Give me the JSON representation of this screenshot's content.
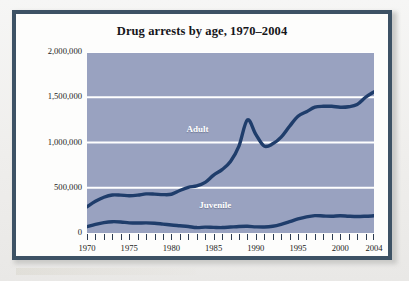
{
  "figure": {
    "frame_color": "#3d5265",
    "page_background": "#f1f0ee",
    "inner_background": "#fdfdfc"
  },
  "chart_data": {
    "type": "line",
    "title": "Drug arrests by age, 1970–2004",
    "xlabel": "",
    "ylabel": "",
    "xlim": [
      1970,
      2004
    ],
    "ylim": [
      0,
      2000000
    ],
    "grid": true,
    "gridline_color": "#ffffff",
    "plot_background": "#99a2c0",
    "line_color": "#1f3d6b",
    "legend_position": "inline-labels",
    "ytick_labels": [
      "0",
      "500,000",
      "1,000,000",
      "1,500,000",
      "2,000,000"
    ],
    "ytick_values": [
      0,
      500000,
      1000000,
      1500000,
      2000000
    ],
    "xtick_labels": [
      "1970",
      "1975",
      "1980",
      "1985",
      "1990",
      "1995",
      "2000",
      "2004"
    ],
    "xtick_values": [
      1970,
      1975,
      1980,
      1985,
      1990,
      1995,
      2000,
      2004
    ],
    "minor_xticks_every": 1,
    "x": [
      1970,
      1971,
      1972,
      1973,
      1974,
      1975,
      1976,
      1977,
      1978,
      1979,
      1980,
      1981,
      1982,
      1983,
      1984,
      1985,
      1986,
      1987,
      1988,
      1989,
      1990,
      1991,
      1992,
      1993,
      1994,
      1995,
      1996,
      1997,
      1998,
      1999,
      2000,
      2001,
      2002,
      2003,
      2004
    ],
    "series": [
      {
        "name": "Adult",
        "label": "Adult",
        "label_x": 1983.1,
        "label_y": 1140000,
        "values": [
          290000,
          350000,
          395000,
          420000,
          418000,
          412000,
          418000,
          432000,
          430000,
          424000,
          428000,
          470000,
          505000,
          520000,
          560000,
          640000,
          700000,
          790000,
          960000,
          1250000,
          1090000,
          960000,
          985000,
          1060000,
          1180000,
          1290000,
          1340000,
          1390000,
          1400000,
          1400000,
          1390000,
          1395000,
          1420000,
          1500000,
          1560000
        ]
      },
      {
        "name": "Juvenile",
        "label": "Juvenile",
        "label_x": 1985.2,
        "label_y": 300000,
        "values": [
          70000,
          95000,
          115000,
          125000,
          122000,
          112000,
          110000,
          112000,
          108000,
          98000,
          88000,
          80000,
          72000,
          60000,
          65000,
          62000,
          60000,
          66000,
          72000,
          74000,
          68000,
          66000,
          74000,
          95000,
          125000,
          155000,
          178000,
          192000,
          188000,
          185000,
          190000,
          185000,
          182000,
          185000,
          190000
        ]
      }
    ]
  }
}
